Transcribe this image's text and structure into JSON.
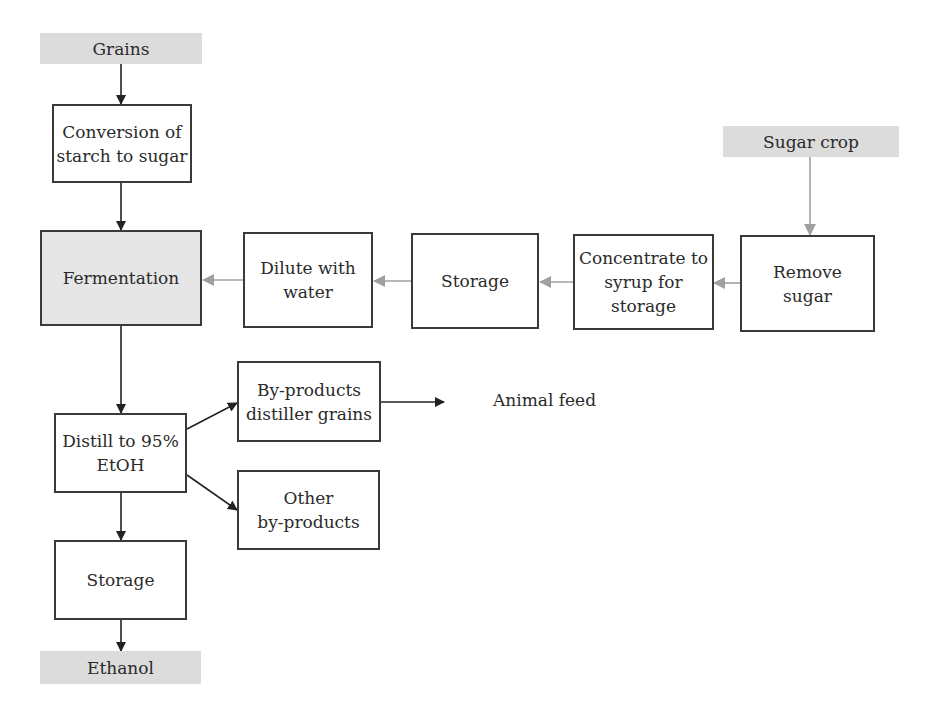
{
  "diagram": {
    "type": "flowchart",
    "colors": {
      "border": "#3a3a3a",
      "shaded": "#dcdcdc",
      "dark_arrow": "#222222",
      "grey_arrow": "#a0a0a0"
    },
    "nodes": {
      "grains": {
        "label": "Grains",
        "style": "shaded-input"
      },
      "conversion": {
        "label": "Conversion of\nstarch to sugar"
      },
      "fermentation": {
        "label": "Fermentation",
        "style": "shaded-box"
      },
      "dilute": {
        "label": "Dilute with\nwater"
      },
      "storage_syrup": {
        "label": "Storage"
      },
      "concentrate": {
        "label": "Concentrate to\nsyrup for\nstorage"
      },
      "remove_sugar": {
        "label": "Remove\nsugar"
      },
      "sugar_crop": {
        "label": "Sugar crop",
        "style": "shaded-input"
      },
      "distill": {
        "label": "Distill to 95%\nEtOH"
      },
      "byproducts_grains": {
        "label": "By-products\ndistiller grains"
      },
      "other_byproducts": {
        "label": "Other\nby-products"
      },
      "storage_ethanol": {
        "label": "Storage"
      },
      "ethanol": {
        "label": "Ethanol",
        "style": "shaded-output"
      },
      "animal_feed": {
        "label": "Animal feed",
        "style": "plain-text"
      }
    },
    "edges": [
      {
        "from": "grains",
        "to": "conversion",
        "color": "dark"
      },
      {
        "from": "conversion",
        "to": "fermentation",
        "color": "dark"
      },
      {
        "from": "sugar_crop",
        "to": "remove_sugar",
        "color": "grey"
      },
      {
        "from": "remove_sugar",
        "to": "concentrate",
        "color": "grey"
      },
      {
        "from": "concentrate",
        "to": "storage_syrup",
        "color": "grey"
      },
      {
        "from": "storage_syrup",
        "to": "dilute",
        "color": "grey"
      },
      {
        "from": "dilute",
        "to": "fermentation",
        "color": "grey"
      },
      {
        "from": "fermentation",
        "to": "distill",
        "color": "dark"
      },
      {
        "from": "distill",
        "to": "byproducts_grains",
        "color": "dark"
      },
      {
        "from": "distill",
        "to": "other_byproducts",
        "color": "dark"
      },
      {
        "from": "byproducts_grains",
        "to": "animal_feed",
        "color": "dark"
      },
      {
        "from": "distill",
        "to": "storage_ethanol",
        "color": "dark"
      },
      {
        "from": "storage_ethanol",
        "to": "ethanol",
        "color": "dark"
      }
    ]
  }
}
